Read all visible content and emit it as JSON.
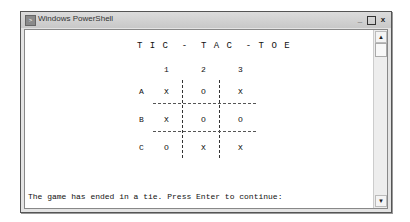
{
  "window": {
    "title": "Windows PowerShell",
    "app_icon": "powershell-icon",
    "controls": {
      "minimize": "_",
      "maximize": "□",
      "close": "x"
    }
  },
  "game": {
    "title": "T I C  -  T A C  - T O E",
    "columns": [
      "1",
      "2",
      "3"
    ],
    "rows": [
      {
        "label": "A",
        "cells": [
          "X",
          "O",
          "X"
        ]
      },
      {
        "label": "B",
        "cells": [
          "X",
          "O",
          "O"
        ]
      },
      {
        "label": "C",
        "cells": [
          "O",
          "X",
          "X"
        ]
      }
    ],
    "status": "The game has ended in a tie. Press Enter to continue:"
  },
  "scrollbar": {
    "up": "▲",
    "down": "▼"
  }
}
